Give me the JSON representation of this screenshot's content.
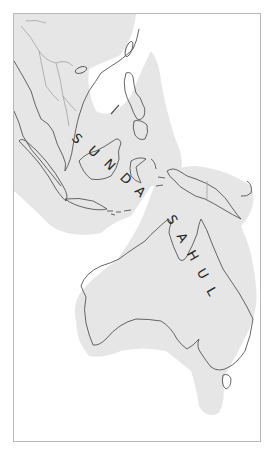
{
  "map": {
    "regions": [
      {
        "id": "sunda",
        "name": "SUNDA"
      },
      {
        "id": "sahul",
        "name": "SAHUL"
      }
    ],
    "labels": {
      "sunda": [
        "S",
        "U",
        "N",
        "D",
        "A"
      ],
      "sahul": [
        "S",
        "A",
        "H",
        "U",
        "L"
      ]
    },
    "colors": {
      "shelf": "#e6e6e6",
      "coastline": "#555555",
      "border": "#9a9a9a",
      "frame": "#b8b8b8",
      "sea": "#ffffff",
      "label": "#222222"
    }
  }
}
